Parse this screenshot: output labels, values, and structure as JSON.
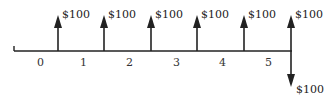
{
  "diagram": {
    "type": "cash-flow-timeline",
    "periods": [
      "0",
      "1",
      "2",
      "3",
      "4",
      "5"
    ],
    "inflows": [
      {
        "label": "$100",
        "position": 1
      },
      {
        "label": "$100",
        "position": 2
      },
      {
        "label": "$100",
        "position": 3
      },
      {
        "label": "$100",
        "position": 4
      },
      {
        "label": "$100",
        "position": 5
      },
      {
        "label": "$100",
        "position": 6
      }
    ],
    "outflows": [
      {
        "label": "$100",
        "position": 6
      }
    ],
    "colors": {
      "line": "#222222",
      "text": "#222222",
      "background": "#ffffff"
    }
  }
}
